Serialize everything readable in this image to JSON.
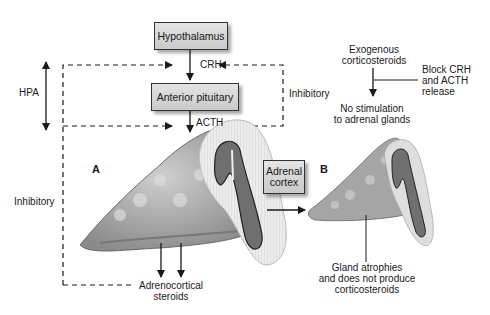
{
  "diagram": {
    "boxes": {
      "hypothalamus": "Hypothalamus",
      "anterior_pituitary": "Anterior pituitary",
      "adrenal_cortex_line1": "Adrenal",
      "adrenal_cortex_line2": "cortex"
    },
    "labels": {
      "crh": "CRH",
      "acth": "ACTH",
      "hpa": "HPA",
      "inhibitory_left": "Inhibitory",
      "inhibitory_right": "Inhibitory",
      "panel_a": "A",
      "panel_b": "B",
      "adrenocortical_line1": "Adrenocortical",
      "adrenocortical_line2": "steroids",
      "exogenous_line1": "Exogenous",
      "exogenous_line2": "corticosteroids",
      "block_line1": "Block CRH",
      "block_line2": "and ACTH",
      "block_line3": "release",
      "no_stim_line1": "No stimulation",
      "no_stim_line2": "to adrenal glands",
      "atrophy_line1": "Gland atrophies",
      "atrophy_line2": "and does not produce",
      "atrophy_line3": "corticosteroids"
    },
    "colors": {
      "gland_fill": "#a9a9a9",
      "medulla_fill": "#6f6f6f",
      "capsule_fill": "#e8e8e8",
      "box_fill": "#d6d6d6",
      "line": "#1a1a1a"
    }
  }
}
